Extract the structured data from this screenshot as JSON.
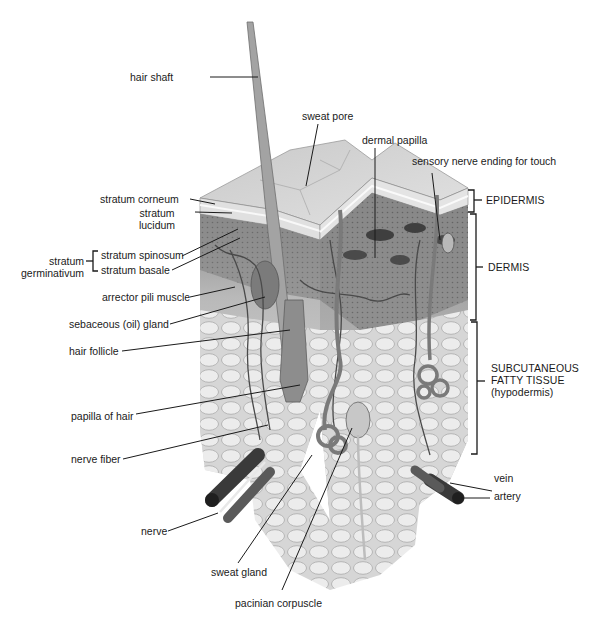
{
  "diagram": {
    "colors": {
      "background": "#ffffff",
      "leader_line": "#1a1a1a",
      "epidermis_surface": "#cfcfcf",
      "dermis": "#8f8f8f",
      "dermis_dark": "#5a5a5a",
      "subcutaneous": "#d8d8d8",
      "fat_lobule": "#e9e9e9",
      "hair": "#9a9a9a",
      "vessel": "#3a3a3a"
    },
    "labels_left": {
      "hair_shaft": "hair shaft",
      "stratum_corneum": "stratum corneum",
      "stratum_lucidum_1": "stratum",
      "stratum_lucidum_2": "lucidum",
      "stratum_germinativum_1": "stratum",
      "stratum_germinativum_2": "germinativum",
      "stratum_spinosum": "stratum spinosum",
      "stratum_basale": "stratum basale",
      "arrector_pili_muscle": "arrector pili muscle",
      "sebaceous_gland": "sebaceous (oil) gland",
      "hair_follicle": "hair follicle",
      "papilla_of_hair": "papilla of hair",
      "nerve_fiber": "nerve fiber",
      "nerve": "nerve"
    },
    "labels_bottom": {
      "sweat_gland": "sweat gland",
      "pacinian_corpuscle": "pacinian corpuscle"
    },
    "labels_top": {
      "sweat_pore": "sweat pore",
      "dermal_papilla": "dermal papilla",
      "sensory_nerve_ending": "sensory nerve ending for touch"
    },
    "labels_right": {
      "epidermis": "EPIDERMIS",
      "dermis": "DERMIS",
      "subcutaneous_1": "SUBCUTANEOUS",
      "subcutaneous_2": "FATTY TISSUE",
      "subcutaneous_3": "(hypodermis)",
      "vein": "vein",
      "artery": "artery"
    }
  }
}
